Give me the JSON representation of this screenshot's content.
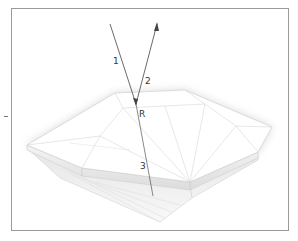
{
  "figure": {
    "labels": {
      "ray_incident": "1",
      "ray_reflected": "2",
      "point": "R",
      "ray_refracted": "3"
    },
    "colors": {
      "frame": "#9a9a9a",
      "ray": "#444444",
      "facet_line": "#cfcfcf",
      "shadow": "#d8d8d8"
    }
  }
}
